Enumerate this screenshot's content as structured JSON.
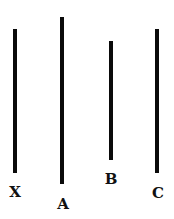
{
  "diagram": {
    "lines": [
      {
        "id": "X",
        "label": "X",
        "x": 13,
        "top": 29,
        "bottom": 173
      },
      {
        "id": "A",
        "label": "A",
        "x": 60,
        "top": 17,
        "bottom": 184
      },
      {
        "id": "B",
        "label": "B",
        "x": 109,
        "top": 41,
        "bottom": 160
      },
      {
        "id": "C",
        "label": "C",
        "x": 155,
        "top": 29,
        "bottom": 173
      }
    ],
    "colors": {
      "line": "#0a0a0a",
      "background": "#ffffff"
    }
  }
}
